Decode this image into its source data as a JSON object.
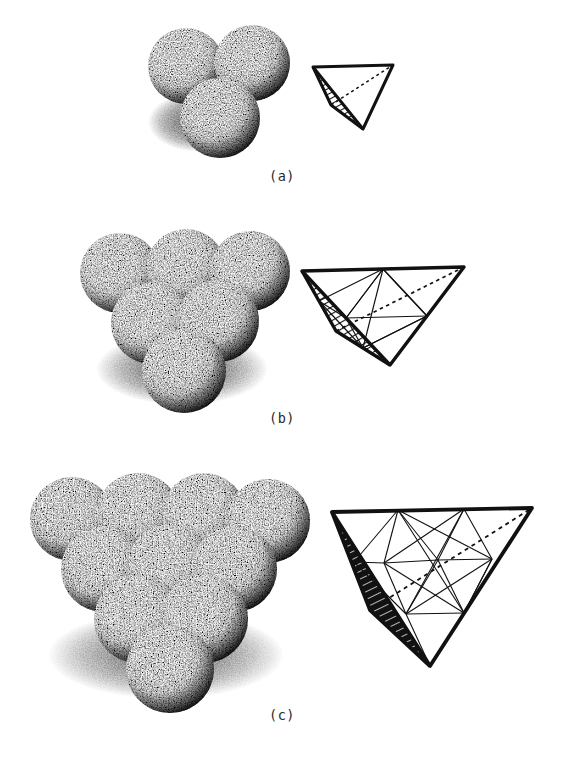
{
  "figure": {
    "background_color": "#ffffff",
    "ink_color": "#111111",
    "style": "stippled pen-and-ink scientific illustration"
  },
  "panels": [
    {
      "id": "a",
      "caption": "(a)",
      "cluster": {
        "name": "four-sphere-tetrahedral-cluster",
        "edge_spheres": 2,
        "total_spheres": 4,
        "visible_spheres": 3,
        "rows": [
          2,
          1
        ],
        "sphere_radius_px": 38
      },
      "tetrahedron": {
        "name": "tetrahedron-order-1",
        "subdivision": 1,
        "shaded_face": "left",
        "shading": "hatched",
        "hidden_edge_style": "dotted",
        "internal_lines": 0
      }
    },
    {
      "id": "b",
      "caption": "(b)",
      "cluster": {
        "name": "ten-sphere-tetrahedral-cluster",
        "edge_spheres": 3,
        "total_spheres": 10,
        "visible_spheres": 6,
        "rows": [
          3,
          2,
          1
        ],
        "sphere_radius_px": 40
      },
      "tetrahedron": {
        "name": "tetrahedron-order-2",
        "subdivision": 2,
        "shaded_face": "left",
        "shading": "hatched",
        "hidden_edge_style": "dotted",
        "internal_lines": 12,
        "inner_cavity": "octahedron"
      }
    },
    {
      "id": "c",
      "caption": "(c)",
      "cluster": {
        "name": "twenty-sphere-tetrahedral-cluster",
        "edge_spheres": 4,
        "total_spheres": 20,
        "visible_spheres": 10,
        "rows": [
          4,
          3,
          2,
          1
        ],
        "sphere_radius_px": 42
      },
      "tetrahedron": {
        "name": "tetrahedron-order-3",
        "subdivision": 3,
        "shaded_face": "left",
        "shading": "solid-black-with-hatching",
        "hidden_edge_style": "dotted",
        "internal_lines": 24,
        "inner_cavity": "octahedra-and-tetrahedra"
      }
    }
  ]
}
